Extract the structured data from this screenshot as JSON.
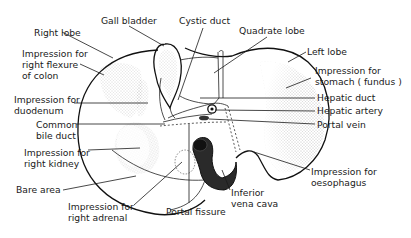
{
  "figure": {
    "labels": {
      "right_lobe": "Right lobe",
      "gall_bladder": "Gall bladder",
      "cystic_duct": "Cystic duct",
      "quadrate_lobe": "Quadrate lobe",
      "left_lobe": "Left lobe",
      "imp_colon_1": "Impression for",
      "imp_colon_2": "right flexure",
      "imp_colon_3": "of colon",
      "imp_stomach_1": "Impression for",
      "imp_stomach_2": "stomach ( fundus )",
      "imp_duodenum_1": "Impression for",
      "imp_duodenum_2": "duodenum",
      "hepatic_duct": "Hepatic duct",
      "hepatic_artery": "Hepatic artery",
      "portal_vein": "Portal vein",
      "common_bile_1": "Common",
      "common_bile_2": "bile duct",
      "imp_kidney_1": "Impression for",
      "imp_kidney_2": "right kidney",
      "bare_area": "Bare area",
      "imp_adrenal_1": "Impression for",
      "imp_adrenal_2": "right adrenal",
      "portal_fissure": "Portal fissure",
      "ivc_1": "Inferior",
      "ivc_2": "vena cava",
      "imp_oesophagus_1": "Impression for",
      "imp_oesophagus_2": "oesophagus"
    }
  }
}
